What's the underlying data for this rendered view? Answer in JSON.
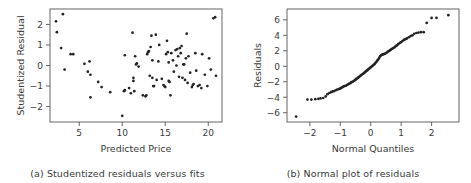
{
  "figure": {
    "background": "#ffffff",
    "point_color": "#222222",
    "axis_color": "#555555"
  },
  "panels": [
    {
      "key": "a",
      "caption": "(a) Studentized residuals versus fits",
      "xlabel": "Predicted Price",
      "ylabel": "Studentized Residual"
    },
    {
      "key": "b",
      "caption": "(b) Normal plot of residuals",
      "xlabel": "Normal Quantiles",
      "ylabel": "Residuals"
    }
  ],
  "chart_data": [
    {
      "type": "scatter",
      "title": "(a) Studentized residuals versus fits",
      "xlabel": "Predicted Price",
      "ylabel": "Studentized Residual",
      "xlim": [
        1.6,
        21.6
      ],
      "ylim": [
        -2.75,
        2.75
      ],
      "xticks": [
        5,
        10,
        15,
        20
      ],
      "yticks": [
        -2,
        -1,
        0,
        1,
        2
      ],
      "grid": false,
      "legend": null,
      "points": [
        [
          2.3,
          2.15
        ],
        [
          3.1,
          2.5
        ],
        [
          2.4,
          1.62
        ],
        [
          2.9,
          0.85
        ],
        [
          3.3,
          -0.2
        ],
        [
          4.0,
          0.55
        ],
        [
          4.3,
          0.55
        ],
        [
          5.6,
          0.08
        ],
        [
          6.2,
          0.2
        ],
        [
          6.0,
          -0.3
        ],
        [
          6.3,
          -0.45
        ],
        [
          6.3,
          -1.55
        ],
        [
          7.2,
          -0.8
        ],
        [
          7.6,
          -1.05
        ],
        [
          8.6,
          -1.3
        ],
        [
          10.0,
          -2.45
        ],
        [
          10.2,
          -1.25
        ],
        [
          10.3,
          -1.2
        ],
        [
          10.3,
          0.5
        ],
        [
          10.8,
          -1.1
        ],
        [
          11.0,
          -1.35
        ],
        [
          11.2,
          1.6
        ],
        [
          11.3,
          -0.75
        ],
        [
          11.3,
          -0.6
        ],
        [
          11.4,
          -1.25
        ],
        [
          11.5,
          0.45
        ],
        [
          11.6,
          0.05
        ],
        [
          11.7,
          0.1
        ],
        [
          11.9,
          -0.05
        ],
        [
          12.4,
          -1.45
        ],
        [
          12.7,
          -1.5
        ],
        [
          12.8,
          -1.45
        ],
        [
          12.9,
          0.55
        ],
        [
          13.0,
          0.65
        ],
        [
          13.1,
          0.7
        ],
        [
          13.2,
          -0.5
        ],
        [
          13.3,
          0.9
        ],
        [
          13.4,
          1.45
        ],
        [
          13.5,
          0.25
        ],
        [
          13.5,
          -0.6
        ],
        [
          13.6,
          -1.0
        ],
        [
          13.7,
          -1.0
        ],
        [
          13.9,
          1.5
        ],
        [
          14.0,
          -0.7
        ],
        [
          14.2,
          0.2
        ],
        [
          14.3,
          1.0
        ],
        [
          14.6,
          -0.65
        ],
        [
          14.8,
          -0.95
        ],
        [
          14.9,
          -1.0
        ],
        [
          15.0,
          -1.05
        ],
        [
          15.1,
          0.55
        ],
        [
          15.2,
          1.2
        ],
        [
          15.3,
          0.65
        ],
        [
          15.4,
          0.15
        ],
        [
          15.4,
          -0.75
        ],
        [
          15.5,
          -0.8
        ],
        [
          15.6,
          -1.45
        ],
        [
          15.7,
          0.6
        ],
        [
          15.9,
          0.25
        ],
        [
          16.0,
          -0.3
        ],
        [
          16.2,
          0.75
        ],
        [
          16.3,
          0.0
        ],
        [
          16.4,
          0.8
        ],
        [
          16.5,
          0.45
        ],
        [
          16.6,
          -0.55
        ],
        [
          16.7,
          0.85
        ],
        [
          16.8,
          0.6
        ],
        [
          16.9,
          0.95
        ],
        [
          17.0,
          -0.6
        ],
        [
          17.1,
          0.05
        ],
        [
          17.2,
          0.05
        ],
        [
          17.3,
          -0.7
        ],
        [
          17.4,
          0.35
        ],
        [
          17.5,
          1.55
        ],
        [
          17.6,
          -0.85
        ],
        [
          17.7,
          0.45
        ],
        [
          17.9,
          -0.35
        ],
        [
          18.1,
          -1.05
        ],
        [
          18.2,
          -0.95
        ],
        [
          18.3,
          -0.9
        ],
        [
          18.5,
          0.6
        ],
        [
          18.6,
          -0.25
        ],
        [
          18.8,
          -1.0
        ],
        [
          19.0,
          -0.95
        ],
        [
          19.2,
          -1.1
        ],
        [
          19.3,
          0.55
        ],
        [
          19.6,
          -0.45
        ],
        [
          19.9,
          -1.0
        ],
        [
          20.1,
          0.35
        ],
        [
          20.3,
          -0.2
        ],
        [
          20.6,
          2.3
        ],
        [
          20.8,
          2.35
        ],
        [
          20.9,
          -0.5
        ]
      ]
    },
    {
      "type": "scatter",
      "title": "(b) Normal plot of residuals",
      "xlabel": "Normal Quantiles",
      "ylabel": "Residuals",
      "xlim": [
        -2.75,
        2.9
      ],
      "ylim": [
        -7.2,
        7.4
      ],
      "xticks": [
        -2,
        -1,
        0,
        1,
        2
      ],
      "yticks": [
        -6,
        -4,
        -2,
        0,
        2,
        4,
        6
      ],
      "grid": false,
      "legend": null,
      "points": [
        [
          -2.45,
          -6.5
        ],
        [
          -2.08,
          -4.3
        ],
        [
          -1.95,
          -4.3
        ],
        [
          -1.82,
          -4.25
        ],
        [
          -1.72,
          -4.2
        ],
        [
          -1.65,
          -4.15
        ],
        [
          -1.56,
          -4.1
        ],
        [
          -1.48,
          -3.9
        ],
        [
          -1.42,
          -3.6
        ],
        [
          -1.36,
          -3.45
        ],
        [
          -1.3,
          -3.35
        ],
        [
          -1.25,
          -3.25
        ],
        [
          -1.2,
          -3.2
        ],
        [
          -1.15,
          -3.1
        ],
        [
          -1.1,
          -3.0
        ],
        [
          -1.05,
          -2.95
        ],
        [
          -1.01,
          -2.9
        ],
        [
          -0.97,
          -2.8
        ],
        [
          -0.93,
          -2.7
        ],
        [
          -0.89,
          -2.6
        ],
        [
          -0.85,
          -2.55
        ],
        [
          -0.81,
          -2.5
        ],
        [
          -0.77,
          -2.4
        ],
        [
          -0.73,
          -2.3
        ],
        [
          -0.7,
          -2.25
        ],
        [
          -0.66,
          -2.15
        ],
        [
          -0.63,
          -2.05
        ],
        [
          -0.59,
          -2.0
        ],
        [
          -0.56,
          -1.9
        ],
        [
          -0.52,
          -1.8
        ],
        [
          -0.49,
          -1.7
        ],
        [
          -0.46,
          -1.6
        ],
        [
          -0.42,
          -1.5
        ],
        [
          -0.39,
          -1.4
        ],
        [
          -0.36,
          -1.3
        ],
        [
          -0.33,
          -1.2
        ],
        [
          -0.3,
          -1.1
        ],
        [
          -0.26,
          -1.0
        ],
        [
          -0.23,
          -0.9
        ],
        [
          -0.2,
          -0.8
        ],
        [
          -0.17,
          -0.7
        ],
        [
          -0.14,
          -0.6
        ],
        [
          -0.11,
          -0.5
        ],
        [
          -0.08,
          -0.4
        ],
        [
          -0.05,
          -0.3
        ],
        [
          -0.02,
          -0.2
        ],
        [
          0.01,
          -0.1
        ],
        [
          0.04,
          0.0
        ],
        [
          0.07,
          0.1
        ],
        [
          0.1,
          0.2
        ],
        [
          0.13,
          0.3
        ],
        [
          0.16,
          0.45
        ],
        [
          0.19,
          0.6
        ],
        [
          0.22,
          0.75
        ],
        [
          0.25,
          0.9
        ],
        [
          0.28,
          1.1
        ],
        [
          0.31,
          1.3
        ],
        [
          0.35,
          1.45
        ],
        [
          0.38,
          1.5
        ],
        [
          0.41,
          1.55
        ],
        [
          0.45,
          1.6
        ],
        [
          0.48,
          1.65
        ],
        [
          0.52,
          1.75
        ],
        [
          0.55,
          1.85
        ],
        [
          0.59,
          1.95
        ],
        [
          0.63,
          2.05
        ],
        [
          0.66,
          2.15
        ],
        [
          0.7,
          2.25
        ],
        [
          0.74,
          2.35
        ],
        [
          0.78,
          2.45
        ],
        [
          0.82,
          2.6
        ],
        [
          0.86,
          2.7
        ],
        [
          0.9,
          2.85
        ],
        [
          0.95,
          3.0
        ],
        [
          0.99,
          3.1
        ],
        [
          1.04,
          3.25
        ],
        [
          1.09,
          3.4
        ],
        [
          1.14,
          3.5
        ],
        [
          1.19,
          3.6
        ],
        [
          1.25,
          3.75
        ],
        [
          1.31,
          3.9
        ],
        [
          1.37,
          4.0
        ],
        [
          1.43,
          4.2
        ],
        [
          1.5,
          4.3
        ],
        [
          1.57,
          4.35
        ],
        [
          1.65,
          4.4
        ],
        [
          1.74,
          4.4
        ],
        [
          1.84,
          5.6
        ],
        [
          2.0,
          6.25
        ],
        [
          2.16,
          6.25
        ],
        [
          2.55,
          6.6
        ]
      ]
    }
  ]
}
